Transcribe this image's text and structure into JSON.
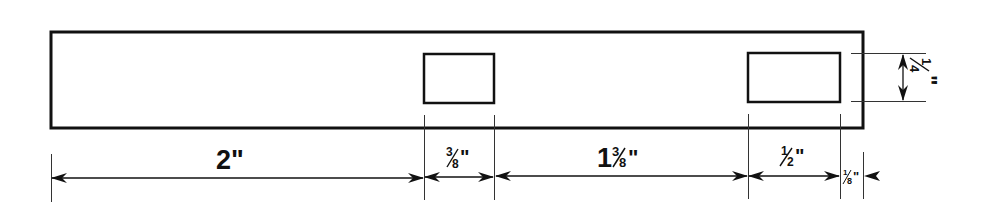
{
  "diagram": {
    "type": "dimensioned-technical-drawing",
    "part": {
      "shape": "rectangular-strip",
      "slots": [
        {
          "id": "slot-1",
          "width_label": "3/8\"",
          "height_label": "1/4\""
        },
        {
          "id": "slot-2",
          "width_label": "1/2\"",
          "height_label": "1/4\""
        }
      ]
    },
    "dimensions": {
      "d1": {
        "whole": "2",
        "num": "",
        "den": "",
        "unit": "\"",
        "meaning": "left end to first slot"
      },
      "d2": {
        "whole": "",
        "num": "3",
        "den": "8",
        "unit": "\"",
        "meaning": "first slot width"
      },
      "d3": {
        "whole": "1",
        "num": "3",
        "den": "8",
        "unit": "\"",
        "meaning": "between slots"
      },
      "d4": {
        "whole": "",
        "num": "1",
        "den": "2",
        "unit": "\"",
        "meaning": "second slot width"
      },
      "d5": {
        "whole": "",
        "num": "1",
        "den": "8",
        "unit": "\"",
        "meaning": "second slot to right end"
      },
      "d6": {
        "whole": "",
        "num": "1",
        "den": "4",
        "unit": "\"",
        "meaning": "slot height"
      }
    },
    "colors": {
      "line": "#111111",
      "background": "#ffffff"
    }
  }
}
